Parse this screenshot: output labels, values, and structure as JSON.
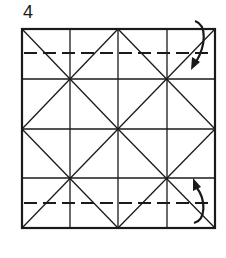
{
  "step": {
    "number": "4"
  },
  "diagram": {
    "colors": {
      "line": "#1a1a1a",
      "background": "#ffffff"
    },
    "square": {
      "x": 22,
      "y": 29,
      "width": 193,
      "height": 199
    },
    "vertical_lines_x": [
      70,
      118,
      167
    ],
    "horizontal_lines_y": [
      79,
      129,
      178
    ],
    "dashed_lines_y": [
      53,
      203
    ],
    "arrows": [
      {
        "name": "fold-down-arrow",
        "direction": "down",
        "position": "top-right"
      },
      {
        "name": "fold-up-arrow",
        "direction": "up",
        "position": "bottom-right"
      }
    ]
  }
}
